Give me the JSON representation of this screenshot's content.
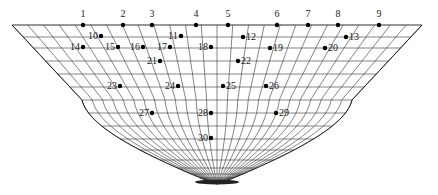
{
  "diagram": {
    "type": "funnel-mesh",
    "stroke_color": "#333333",
    "point_color": "#000000",
    "points": [
      {
        "id": "1",
        "x": 83,
        "y": 25,
        "label_pos": "top"
      },
      {
        "id": "2",
        "x": 123,
        "y": 25,
        "label_pos": "top"
      },
      {
        "id": "3",
        "x": 152,
        "y": 25,
        "label_pos": "top"
      },
      {
        "id": "4",
        "x": 196,
        "y": 25,
        "label_pos": "top"
      },
      {
        "id": "5",
        "x": 228,
        "y": 25,
        "label_pos": "top"
      },
      {
        "id": "6",
        "x": 277,
        "y": 25,
        "label_pos": "top"
      },
      {
        "id": "7",
        "x": 308,
        "y": 25,
        "label_pos": "top"
      },
      {
        "id": "8",
        "x": 338,
        "y": 25,
        "label_pos": "top"
      },
      {
        "id": "9",
        "x": 379,
        "y": 25,
        "label_pos": "top"
      },
      {
        "id": "10",
        "x": 101,
        "y": 36,
        "label_pos": "left"
      },
      {
        "id": "11",
        "x": 181,
        "y": 36,
        "label_pos": "left"
      },
      {
        "id": "12",
        "x": 243,
        "y": 37,
        "label_pos": "right"
      },
      {
        "id": "13",
        "x": 346,
        "y": 37,
        "label_pos": "right"
      },
      {
        "id": "14",
        "x": 83,
        "y": 47,
        "label_pos": "left"
      },
      {
        "id": "15",
        "x": 118,
        "y": 47,
        "label_pos": "left"
      },
      {
        "id": "16",
        "x": 143,
        "y": 47,
        "label_pos": "left"
      },
      {
        "id": "17",
        "x": 170,
        "y": 47,
        "label_pos": "left"
      },
      {
        "id": "18",
        "x": 211,
        "y": 47,
        "label_pos": "left"
      },
      {
        "id": "19",
        "x": 270,
        "y": 48,
        "label_pos": "right"
      },
      {
        "id": "20",
        "x": 325,
        "y": 48,
        "label_pos": "right"
      },
      {
        "id": "21",
        "x": 160,
        "y": 61,
        "label_pos": "left"
      },
      {
        "id": "22",
        "x": 238,
        "y": 61,
        "label_pos": "right"
      },
      {
        "id": "23",
        "x": 120,
        "y": 86,
        "label_pos": "left"
      },
      {
        "id": "24",
        "x": 178,
        "y": 86,
        "label_pos": "left"
      },
      {
        "id": "25",
        "x": 223,
        "y": 86,
        "label_pos": "right"
      },
      {
        "id": "26",
        "x": 266,
        "y": 86,
        "label_pos": "right"
      },
      {
        "id": "27",
        "x": 152,
        "y": 113,
        "label_pos": "left"
      },
      {
        "id": "28",
        "x": 211,
        "y": 113,
        "label_pos": "left"
      },
      {
        "id": "29",
        "x": 276,
        "y": 113,
        "label_pos": "right"
      },
      {
        "id": "30",
        "x": 211,
        "y": 138,
        "label_pos": "left"
      }
    ]
  }
}
